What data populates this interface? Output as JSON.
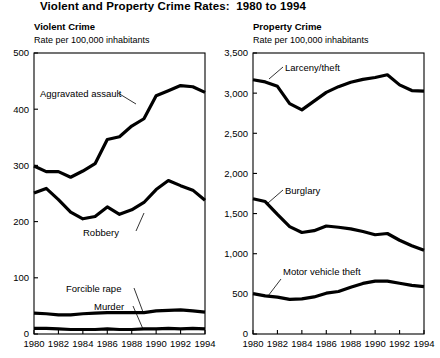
{
  "figure": {
    "title": "Violent and Property Crime Rates:  1980 to 1994"
  },
  "panels": {
    "left": {
      "title": "Violent Crime",
      "subtitle": "Rate per 100,000 inhabitants"
    },
    "right": {
      "title": "Property Crime",
      "subtitle": "Rate per 100,000 inhabitants"
    }
  },
  "chart_data": [
    {
      "type": "line",
      "title": "Violent Crime",
      "subtitle": "Rate per 100,000 inhabitants",
      "xlabel": "",
      "ylabel": "Rate per 100,000 inhabitants",
      "x": [
        1980,
        1981,
        1982,
        1983,
        1984,
        1985,
        1986,
        1987,
        1988,
        1989,
        1990,
        1991,
        1992,
        1993,
        1994
      ],
      "xlim": [
        1980,
        1994
      ],
      "xticks": [
        1980,
        1982,
        1984,
        1986,
        1988,
        1990,
        1992,
        1994
      ],
      "xtick_labels": [
        "1980",
        "1982",
        "1984",
        "1986",
        "1988",
        "1990",
        "1992",
        "1994"
      ],
      "ylim": [
        0,
        500
      ],
      "yticks": [
        0,
        100,
        200,
        300,
        400,
        500
      ],
      "ytick_labels": [
        "0",
        "100",
        "200",
        "300",
        "400",
        "500"
      ],
      "grid": false,
      "legend": "inline-annotations",
      "series": [
        {
          "name": "Aggravated assault",
          "values": [
            299,
            289,
            289,
            279,
            290,
            303,
            346,
            351,
            370,
            383,
            424,
            433,
            442,
            440,
            430
          ]
        },
        {
          "name": "Robbery",
          "values": [
            251,
            259,
            239,
            217,
            205,
            209,
            226,
            213,
            221,
            234,
            257,
            273,
            264,
            256,
            238
          ]
        },
        {
          "name": "Forcible rape",
          "values": [
            37,
            36,
            34,
            34,
            36,
            37,
            38,
            38,
            38,
            38,
            41,
            42,
            43,
            41,
            39
          ]
        },
        {
          "name": "Murder",
          "values": [
            10,
            10,
            9,
            8,
            8,
            8,
            9,
            8,
            8,
            9,
            9,
            10,
            9,
            10,
            9
          ]
        }
      ]
    },
    {
      "type": "line",
      "title": "Property Crime",
      "subtitle": "Rate per 100,000 inhabitants",
      "xlabel": "",
      "ylabel": "Rate per 100,000 inhabitants",
      "x": [
        1980,
        1981,
        1982,
        1983,
        1984,
        1985,
        1986,
        1987,
        1988,
        1989,
        1990,
        1991,
        1992,
        1993,
        1994
      ],
      "xlim": [
        1980,
        1994
      ],
      "xticks": [
        1980,
        1982,
        1984,
        1986,
        1988,
        1990,
        1992,
        1994
      ],
      "xtick_labels": [
        "1980",
        "1982",
        "1984",
        "1986",
        "1988",
        "1990",
        "1992",
        "1994"
      ],
      "ylim": [
        0,
        3500
      ],
      "yticks": [
        0,
        500,
        1000,
        1500,
        2000,
        2500,
        3000,
        3500
      ],
      "ytick_labels": [
        "0",
        "500",
        "1,000",
        "1,500",
        "2,000",
        "2,500",
        "3,000",
        "3,500"
      ],
      "grid": false,
      "legend": "inline-annotations",
      "series": [
        {
          "name": "Larceny/theft",
          "values": [
            3167,
            3140,
            3085,
            2869,
            2791,
            2901,
            3010,
            3081,
            3135,
            3171,
            3195,
            3229,
            3103,
            3032,
            3026
          ]
        },
        {
          "name": "Burglary",
          "values": [
            1684,
            1650,
            1489,
            1338,
            1264,
            1287,
            1345,
            1330,
            1309,
            1276,
            1236,
            1252,
            1168,
            1100,
            1042
          ]
        },
        {
          "name": "Motor vehicle theft",
          "values": [
            502,
            475,
            459,
            431,
            437,
            462,
            508,
            529,
            583,
            630,
            658,
            659,
            632,
            606,
            591
          ]
        }
      ]
    }
  ]
}
